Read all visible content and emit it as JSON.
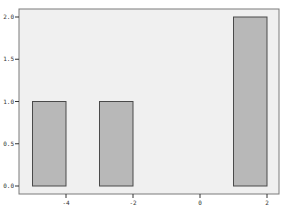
{
  "chart_data": {
    "type": "bar",
    "title": "",
    "xlabel": "",
    "ylabel": "",
    "bars": [
      {
        "x_start": -5,
        "x_end": -4,
        "value": 1.0
      },
      {
        "x_start": -3,
        "x_end": -2,
        "value": 1.0
      },
      {
        "x_start": 1,
        "x_end": 2,
        "value": 2.0
      }
    ],
    "categories": [
      "-5 to -4",
      "-3 to -2",
      "1 to 2"
    ],
    "values": [
      1.0,
      1.0,
      2.0
    ],
    "xlim": [
      -6.0,
      2.4
    ],
    "ylim": [
      0.0,
      2.1
    ],
    "x_ticks": [
      -4,
      -2,
      0,
      2
    ],
    "x_tick_labels": [
      "-4",
      "-2",
      "0",
      "2"
    ],
    "y_ticks": [
      0.0,
      0.5,
      1.0,
      1.5,
      2.0
    ],
    "y_tick_labels": [
      "0.0",
      "0.5",
      "1.0",
      "1.5",
      "2.0"
    ],
    "grid": false,
    "legend": null
  },
  "colors": {
    "plot_background": "#f0f0f0",
    "frame": "#7a7a7a",
    "bar_fill": "#b8b8b8",
    "bar_edge": "#4a4a4a",
    "tick": "#333333"
  }
}
